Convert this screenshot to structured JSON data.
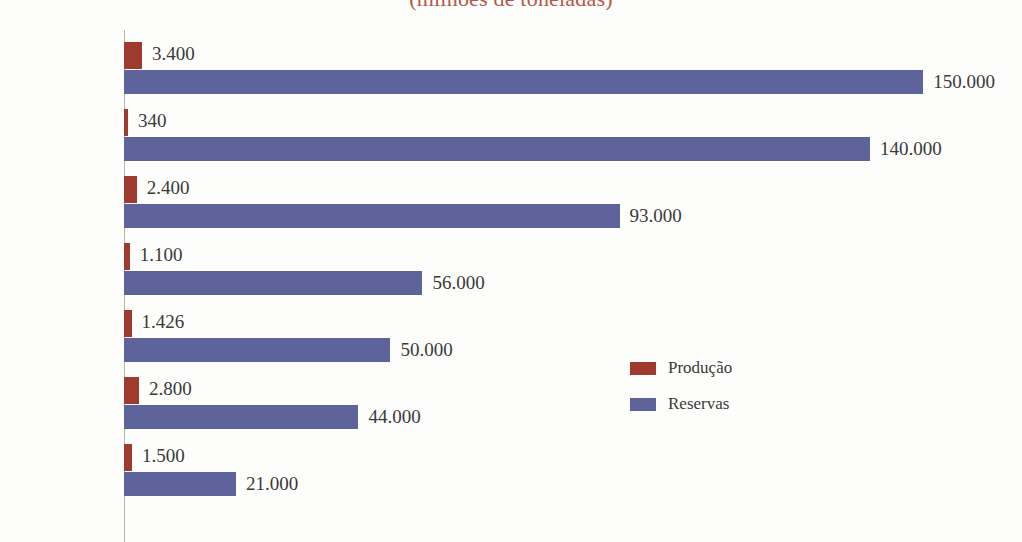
{
  "chart_data": {
    "type": "bar",
    "orientation": "horizontal",
    "title": "(milhões de toneladas)",
    "xlabel": "",
    "ylabel": "",
    "grid": false,
    "legend_position": "center-right",
    "xlim": [
      0,
      150000
    ],
    "categories": [
      "África do Sul",
      "Ucrânia",
      "Austrália",
      "Índia",
      "Brasil",
      "China",
      "Gabão"
    ],
    "highlight_category": "Brasil",
    "series": [
      {
        "name": "Produção",
        "color": "#9e3a2e",
        "values": [
          3400,
          340,
          2400,
          1100,
          1426,
          2800,
          1500
        ],
        "labels": [
          "3.400",
          "340",
          "2.400",
          "1.100",
          "1.426",
          "2.800",
          "1.500"
        ]
      },
      {
        "name": "Reservas",
        "color": "#5f639b",
        "values": [
          150000,
          140000,
          93000,
          56000,
          50000,
          44000,
          21000
        ],
        "labels": [
          "150.000",
          "140.000",
          "93.000",
          "56.000",
          "50.000",
          "44.000",
          "21.000"
        ]
      }
    ]
  },
  "legend": {
    "items": [
      {
        "label": "Produção",
        "color": "#9e3a2e"
      },
      {
        "label": "Reservas",
        "color": "#5f639b"
      }
    ]
  },
  "colors": {
    "production": "#9e3a2e",
    "reserves": "#5f639b",
    "title": "#b4584a",
    "highlight": "#c0392b",
    "axis": "#b9b6ae",
    "background": "#fdfdfb",
    "text": "#2b2b2b"
  }
}
